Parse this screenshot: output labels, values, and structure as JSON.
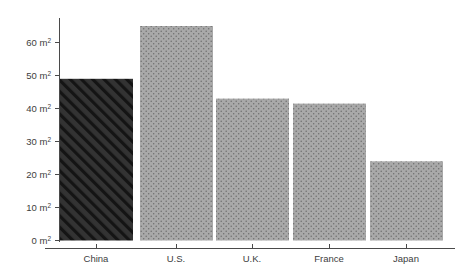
{
  "chart_data": {
    "type": "bar",
    "title": "",
    "subtitle": "",
    "xlabel": "",
    "ylabel": "",
    "categories": [
      "China",
      "U.S.",
      "U.K.",
      "France",
      "Japan"
    ],
    "values": [
      49,
      65,
      43,
      41.5,
      24
    ],
    "unit": "m²",
    "ylim": [
      0,
      67
    ],
    "yticks": [
      0,
      10,
      20,
      30,
      40,
      50,
      60
    ],
    "ytick_labels": [
      "0 m²",
      "10 m²",
      "20 m²",
      "30 m²",
      "40 m²",
      "50 m²",
      "60 m²"
    ],
    "grid": false,
    "legend": null,
    "bars": [
      {
        "category": "China",
        "value": 49,
        "fill": "#333333",
        "pattern": "diagonal-hatch",
        "pattern_color": "#1b1b1b",
        "highlight": true
      },
      {
        "category": "U.S.",
        "value": 65,
        "fill": "#a9a9a9",
        "pattern": "dots",
        "pattern_color": "#6f6f6f",
        "highlight": false
      },
      {
        "category": "U.K.",
        "value": 43,
        "fill": "#a9a9a9",
        "pattern": "dots",
        "pattern_color": "#6f6f6f",
        "highlight": false
      },
      {
        "category": "France",
        "value": 41.5,
        "fill": "#a9a9a9",
        "pattern": "dots",
        "pattern_color": "#6f6f6f",
        "highlight": false
      },
      {
        "category": "Japan",
        "value": 24,
        "fill": "#a9a9a9",
        "pattern": "dots",
        "pattern_color": "#6f6f6f",
        "highlight": false
      }
    ]
  },
  "axes": {
    "axis_color": "#4a4a4a",
    "tick_color": "#4a4a4a",
    "label_color": "#3d3d3d",
    "background": "#ffffff"
  },
  "ytick_texts": {
    "t0": "0 m",
    "t10": "10 m",
    "t20": "20 m",
    "t30": "30 m",
    "t40": "40 m",
    "t50": "50 m",
    "t60": "60 m",
    "sup": "2"
  },
  "xtick_texts": {
    "c0": "China",
    "c1": "U.S.",
    "c2": "U.K.",
    "c3": "France",
    "c4": "Japan"
  }
}
